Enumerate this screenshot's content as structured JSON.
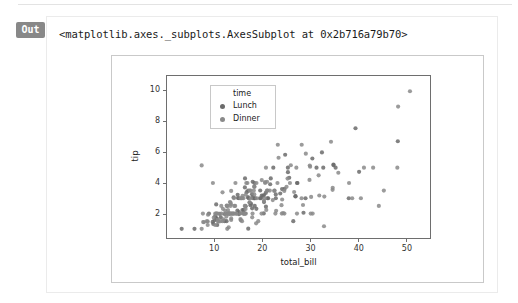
{
  "notebook": {
    "prompt_label": "Out",
    "repr_text": "<matplotlib.axes._subplots.AxesSubplot at 0x2b716a79b70>"
  },
  "colors": {
    "prompt_badge_bg": "#888888",
    "prompt_badge_fg": "#ffffff",
    "card_border": "#ebebeb",
    "figure_border": "#c9c9c9",
    "axes_spine": "#6e6e6e",
    "legend_border": "#c8c8c8",
    "point_lunch": "#6b6b6b",
    "point_dinner": "#8a8a8a",
    "text": "#222222"
  },
  "chart_data": {
    "type": "scatter",
    "title": "",
    "xlabel": "total_bill",
    "ylabel": "tip",
    "xlim": [
      0,
      55
    ],
    "ylim": [
      0.4,
      11
    ],
    "xticks": [
      10,
      20,
      30,
      40,
      50
    ],
    "yticks": [
      2,
      4,
      6,
      8,
      10
    ],
    "grid": false,
    "legend": {
      "title": "time",
      "position": "upper left",
      "entries": [
        {
          "label": "Lunch",
          "color": "#6b6b6b"
        },
        {
          "label": "Dinner",
          "color": "#8a8a8a"
        }
      ]
    },
    "series": [
      {
        "name": "Lunch",
        "color": "#6b6b6b",
        "points": [
          [
            16.99,
            1.01
          ],
          [
            10.34,
            1.66
          ],
          [
            21.01,
            3.5
          ],
          [
            23.68,
            3.31
          ],
          [
            24.59,
            3.61
          ],
          [
            25.29,
            4.71
          ],
          [
            8.77,
            2.0
          ],
          [
            26.88,
            3.12
          ],
          [
            15.04,
            1.96
          ],
          [
            14.78,
            3.23
          ],
          [
            10.27,
            1.71
          ],
          [
            35.26,
            5.0
          ],
          [
            15.42,
            1.57
          ],
          [
            18.43,
            3.0
          ],
          [
            14.83,
            3.02
          ],
          [
            21.58,
            3.92
          ],
          [
            10.33,
            1.67
          ],
          [
            16.29,
            3.71
          ],
          [
            16.97,
            3.5
          ],
          [
            20.65,
            3.35
          ],
          [
            17.92,
            4.08
          ],
          [
            20.29,
            2.75
          ],
          [
            15.77,
            2.23
          ],
          [
            39.42,
            7.58
          ],
          [
            19.82,
            3.18
          ],
          [
            17.81,
            2.34
          ],
          [
            13.37,
            2.0
          ],
          [
            12.69,
            2.0
          ],
          [
            21.7,
            4.3
          ],
          [
            19.65,
            3.0
          ],
          [
            9.55,
            1.45
          ],
          [
            18.35,
            2.5
          ],
          [
            15.06,
            3.0
          ],
          [
            20.69,
            2.45
          ],
          [
            17.78,
            3.27
          ],
          [
            24.06,
            3.6
          ],
          [
            16.31,
            2.0
          ],
          [
            16.93,
            3.07
          ],
          [
            18.69,
            2.31
          ],
          [
            31.27,
            5.0
          ],
          [
            16.04,
            2.24
          ],
          [
            17.46,
            2.54
          ],
          [
            13.94,
            3.06
          ],
          [
            9.68,
            1.32
          ],
          [
            30.4,
            5.6
          ],
          [
            18.29,
            3.0
          ],
          [
            22.23,
            5.0
          ],
          [
            32.4,
            6.0
          ],
          [
            28.55,
            2.05
          ],
          [
            18.04,
            3.0
          ],
          [
            12.54,
            2.5
          ],
          [
            10.29,
            2.6
          ],
          [
            34.81,
            5.2
          ],
          [
            9.94,
            1.56
          ],
          [
            25.56,
            4.34
          ],
          [
            19.49,
            3.51
          ],
          [
            38.01,
            3.0
          ],
          [
            26.41,
            1.5
          ],
          [
            11.24,
            1.76
          ],
          [
            48.27,
            6.73
          ],
          [
            20.29,
            3.21
          ],
          [
            13.81,
            2.0
          ],
          [
            11.02,
            1.98
          ],
          [
            18.29,
            3.76
          ],
          [
            17.59,
            2.64
          ],
          [
            20.08,
            3.15
          ],
          [
            16.45,
            2.47
          ],
          [
            3.07,
            1.0
          ],
          [
            20.23,
            2.01
          ],
          [
            15.01,
            2.09
          ],
          [
            12.02,
            1.97
          ],
          [
            17.07,
            3.0
          ],
          [
            26.86,
            3.14
          ],
          [
            25.28,
            5.0
          ],
          [
            14.73,
            2.2
          ],
          [
            10.51,
            1.25
          ],
          [
            17.92,
            3.08
          ],
          [
            27.2,
            4.0
          ],
          [
            22.76,
            3.0
          ],
          [
            17.29,
            2.71
          ],
          [
            19.44,
            3.0
          ],
          [
            16.66,
            3.4
          ],
          [
            10.07,
            1.83
          ],
          [
            32.68,
            5.0
          ],
          [
            15.98,
            2.03
          ],
          [
            34.83,
            5.17
          ],
          [
            13.03,
            2.0
          ],
          [
            18.28,
            4.0
          ],
          [
            24.71,
            5.85
          ],
          [
            21.16,
            3.0
          ],
          [
            28.97,
            3.0
          ],
          [
            22.49,
            3.5
          ],
          [
            5.75,
            1.0
          ],
          [
            16.32,
            4.3
          ],
          [
            22.75,
            3.25
          ],
          [
            40.17,
            4.73
          ],
          [
            27.28,
            4.0
          ],
          [
            12.03,
            1.5
          ],
          [
            21.01,
            3.0
          ],
          [
            12.46,
            1.5
          ]
        ]
      },
      {
        "name": "Dinner",
        "color": "#8a8a8a",
        "points": [
          [
            11.35,
            2.5
          ],
          [
            15.38,
            3.0
          ],
          [
            44.3,
            2.5
          ],
          [
            22.42,
            3.48
          ],
          [
            20.92,
            4.08
          ],
          [
            15.36,
            1.64
          ],
          [
            20.49,
            4.06
          ],
          [
            25.21,
            4.29
          ],
          [
            18.24,
            3.76
          ],
          [
            14.31,
            4.0
          ],
          [
            14.0,
            3.0
          ],
          [
            7.25,
            1.0
          ],
          [
            38.07,
            4.0
          ],
          [
            23.95,
            2.55
          ],
          [
            25.71,
            4.0
          ],
          [
            17.31,
            3.5
          ],
          [
            29.93,
            5.07
          ],
          [
            10.65,
            1.5
          ],
          [
            12.43,
            1.8
          ],
          [
            24.08,
            2.92
          ],
          [
            11.69,
            2.31
          ],
          [
            13.42,
            1.68
          ],
          [
            14.26,
            2.5
          ],
          [
            15.95,
            2.0
          ],
          [
            12.48,
            2.52
          ],
          [
            29.8,
            4.2
          ],
          [
            8.52,
            1.48
          ],
          [
            14.52,
            2.0
          ],
          [
            11.38,
            2.0
          ],
          [
            22.82,
            2.18
          ],
          [
            19.08,
            1.5
          ],
          [
            20.27,
            2.83
          ],
          [
            11.17,
            1.5
          ],
          [
            12.26,
            2.0
          ],
          [
            18.26,
            3.25
          ],
          [
            8.51,
            1.25
          ],
          [
            10.33,
            2.0
          ],
          [
            14.15,
            2.0
          ],
          [
            16.0,
            2.0
          ],
          [
            13.16,
            2.75
          ],
          [
            17.47,
            3.5
          ],
          [
            34.3,
            6.7
          ],
          [
            41.19,
            5.0
          ],
          [
            27.05,
            5.0
          ],
          [
            16.43,
            2.3
          ],
          [
            8.35,
            1.5
          ],
          [
            18.64,
            1.36
          ],
          [
            11.87,
            1.63
          ],
          [
            9.78,
            1.73
          ],
          [
            7.51,
            2.0
          ],
          [
            14.07,
            2.5
          ],
          [
            13.13,
            2.0
          ],
          [
            17.26,
            2.74
          ],
          [
            24.55,
            2.0
          ],
          [
            19.77,
            2.0
          ],
          [
            29.85,
            5.14
          ],
          [
            48.17,
            5.0
          ],
          [
            25.0,
            3.75
          ],
          [
            13.39,
            2.61
          ],
          [
            16.49,
            2.0
          ],
          [
            21.5,
            3.5
          ],
          [
            12.66,
            2.5
          ],
          [
            16.21,
            2.0
          ],
          [
            13.81,
            2.0
          ],
          [
            17.51,
            3.0
          ],
          [
            24.52,
            3.48
          ],
          [
            20.76,
            2.24
          ],
          [
            31.71,
            4.5
          ],
          [
            10.59,
            1.61
          ],
          [
            10.63,
            2.0
          ],
          [
            50.81,
            10.0
          ],
          [
            15.81,
            3.16
          ],
          [
            7.25,
            5.15
          ],
          [
            31.85,
            3.18
          ],
          [
            16.82,
            4.0
          ],
          [
            32.9,
            3.11
          ],
          [
            17.89,
            2.0
          ],
          [
            14.48,
            2.0
          ],
          [
            9.6,
            4.0
          ],
          [
            34.63,
            3.55
          ],
          [
            34.65,
            3.68
          ],
          [
            23.33,
            5.65
          ],
          [
            45.35,
            3.5
          ],
          [
            23.17,
            6.5
          ],
          [
            40.55,
            3.0
          ],
          [
            20.69,
            5.0
          ],
          [
            20.9,
            3.5
          ],
          [
            30.46,
            2.0
          ],
          [
            18.15,
            3.5
          ],
          [
            23.1,
            4.0
          ],
          [
            15.69,
            1.5
          ],
          [
            19.81,
            4.19
          ],
          [
            28.44,
            2.56
          ],
          [
            15.48,
            2.02
          ],
          [
            16.58,
            4.0
          ],
          [
            7.56,
            1.44
          ],
          [
            10.34,
            2.0
          ],
          [
            43.11,
            5.0
          ],
          [
            13.0,
            2.0
          ],
          [
            13.51,
            2.0
          ],
          [
            18.71,
            4.0
          ],
          [
            12.74,
            2.01
          ],
          [
            13.0,
            2.0
          ],
          [
            16.4,
            2.5
          ],
          [
            20.53,
            4.0
          ],
          [
            16.47,
            3.23
          ],
          [
            26.59,
            3.41
          ],
          [
            38.73,
            3.0
          ],
          [
            24.27,
            2.03
          ],
          [
            12.76,
            2.23
          ],
          [
            30.06,
            2.0
          ],
          [
            25.89,
            5.16
          ],
          [
            48.33,
            9.0
          ],
          [
            13.27,
            2.5
          ],
          [
            28.17,
            6.5
          ],
          [
            12.9,
            1.1
          ],
          [
            28.15,
            3.0
          ],
          [
            11.59,
            1.5
          ],
          [
            7.74,
            1.44
          ],
          [
            30.14,
            3.09
          ],
          [
            12.16,
            2.2
          ],
          [
            13.42,
            3.48
          ],
          [
            8.58,
            1.92
          ],
          [
            15.98,
            3.0
          ],
          [
            13.42,
            1.58
          ],
          [
            16.27,
            2.5
          ],
          [
            10.09,
            2.0
          ],
          [
            20.45,
            3.0
          ],
          [
            13.28,
            2.72
          ],
          [
            22.12,
            2.88
          ],
          [
            24.01,
            2.0
          ],
          [
            15.69,
            3.0
          ],
          [
            11.61,
            3.39
          ],
          [
            10.77,
            1.47
          ],
          [
            15.53,
            3.0
          ],
          [
            10.07,
            1.25
          ],
          [
            12.6,
            1.0
          ],
          [
            32.83,
            1.17
          ],
          [
            35.83,
            4.67
          ],
          [
            29.03,
            5.92
          ],
          [
            27.18,
            2.0
          ],
          [
            22.67,
            2.0
          ],
          [
            17.82,
            1.75
          ],
          [
            18.78,
            3.0
          ]
        ]
      }
    ]
  }
}
